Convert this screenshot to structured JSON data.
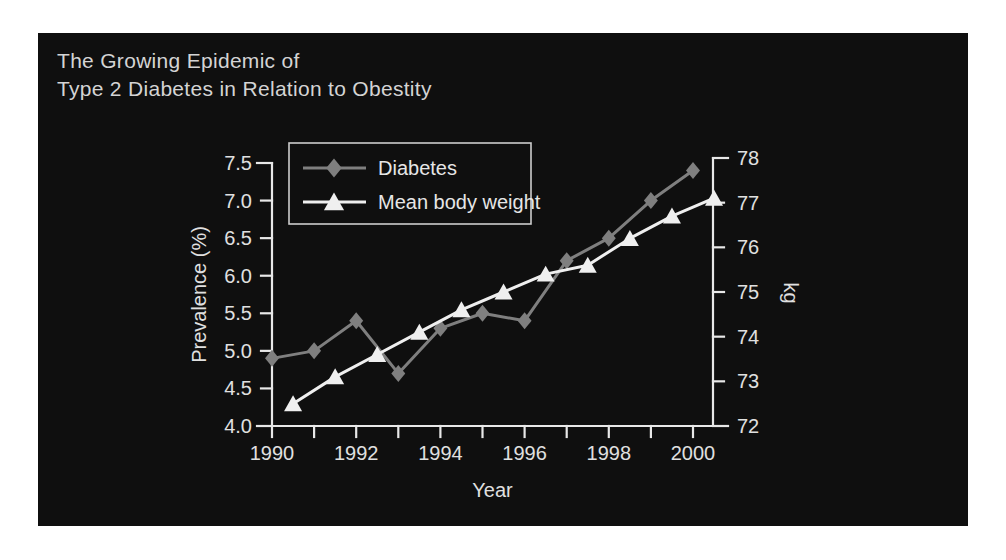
{
  "title": {
    "line1": "The Growing Epidemic of",
    "line2": "Type 2 Diabetes in Relation to Obestity"
  },
  "colors": {
    "page_bg": "#ffffff",
    "panel_bg": "#0f0f0f",
    "axis": "#e8e8e8",
    "tick_text": "#e0e0e0",
    "title_text": "#d4d4d4",
    "legend_border": "#cccccc",
    "diabetes_series": "#7f7f7f",
    "weight_series": "#efefef"
  },
  "chart_data": {
    "type": "line",
    "title": "The Growing Epidemic of Type 2 Diabetes in Relation to Obestity",
    "background": "dark",
    "grid": false,
    "x_axis": {
      "label": "Year",
      "min": 1990,
      "max": 2000,
      "tick_step": 1,
      "labeled_ticks": [
        1990,
        1992,
        1994,
        1996,
        1998,
        2000
      ]
    },
    "y_axis_left": {
      "label": "Prevalence (%)",
      "min": 4.0,
      "max": 7.5,
      "tick_step": 0.5,
      "decimals": 1
    },
    "y_axis_right": {
      "label": "kg",
      "min": 72,
      "max": 78,
      "tick_step": 1,
      "decimals": 0
    },
    "legend": {
      "position": "top-left",
      "entries": [
        "Diabetes",
        "Mean body weight"
      ]
    },
    "series": [
      {
        "name": "Diabetes",
        "axis": "left",
        "marker": "diamond",
        "color": "#7f7f7f",
        "x": [
          1990,
          1991,
          1992,
          1993,
          1994,
          1995,
          1996,
          1997,
          1998,
          1999,
          2000
        ],
        "values": [
          4.9,
          5.0,
          5.4,
          4.7,
          5.3,
          5.5,
          5.4,
          6.2,
          6.5,
          7.0,
          7.4
        ]
      },
      {
        "name": "Mean body weight",
        "axis": "right",
        "marker": "triangle",
        "color": "#efefef",
        "x": [
          1990.5,
          1991.5,
          1992.5,
          1993.5,
          1994.5,
          1995.5,
          1996.5,
          1997.5,
          1998.5,
          1999.5,
          2000.5
        ],
        "values": [
          72.5,
          73.1,
          73.6,
          74.1,
          74.6,
          75.0,
          75.4,
          75.6,
          76.2,
          76.7,
          77.1
        ]
      }
    ]
  }
}
